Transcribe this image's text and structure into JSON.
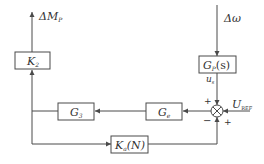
{
  "diagram": {
    "type": "control-block-diagram",
    "blocks": [
      {
        "id": "K2",
        "main": "K",
        "sub": "2",
        "suffix": ""
      },
      {
        "id": "Gp",
        "main": "G",
        "sub": "P",
        "suffix": "(s)"
      },
      {
        "id": "Ge",
        "main": "G",
        "sub": "e",
        "suffix": ""
      },
      {
        "id": "G3",
        "main": "G",
        "sub": "3",
        "suffix": ""
      },
      {
        "id": "Ka",
        "main": "K",
        "sub": "a",
        "suffix": "(N)"
      }
    ],
    "signals": {
      "output": {
        "main": "ΔM",
        "sub": "P"
      },
      "input": {
        "main": "Δω"
      },
      "us": {
        "main": "u",
        "sub": "s"
      },
      "uref": {
        "main": "U",
        "sub": "REF"
      }
    },
    "summing_junction": {
      "symbol": "⊗",
      "signs": {
        "top": "+",
        "right": "+",
        "bottom": "−"
      }
    },
    "connections": [
      {
        "from": "Δω",
        "to": "Gp"
      },
      {
        "from": "Gp",
        "to": "sum",
        "sign": "+",
        "label": "u_s"
      },
      {
        "from": "U_REF",
        "to": "sum",
        "sign": "+"
      },
      {
        "from": "Ka",
        "to": "sum",
        "sign": "−"
      },
      {
        "from": "sum",
        "to": "Ge"
      },
      {
        "from": "Ge",
        "to": "G3"
      },
      {
        "from": "G3",
        "to": "K2"
      },
      {
        "from": "G3",
        "to": "Ka"
      },
      {
        "from": "K2",
        "to": "ΔM_P"
      }
    ],
    "colors": {
      "line": "#4a4a4a",
      "text": "#333333",
      "background": "#ffffff"
    }
  }
}
